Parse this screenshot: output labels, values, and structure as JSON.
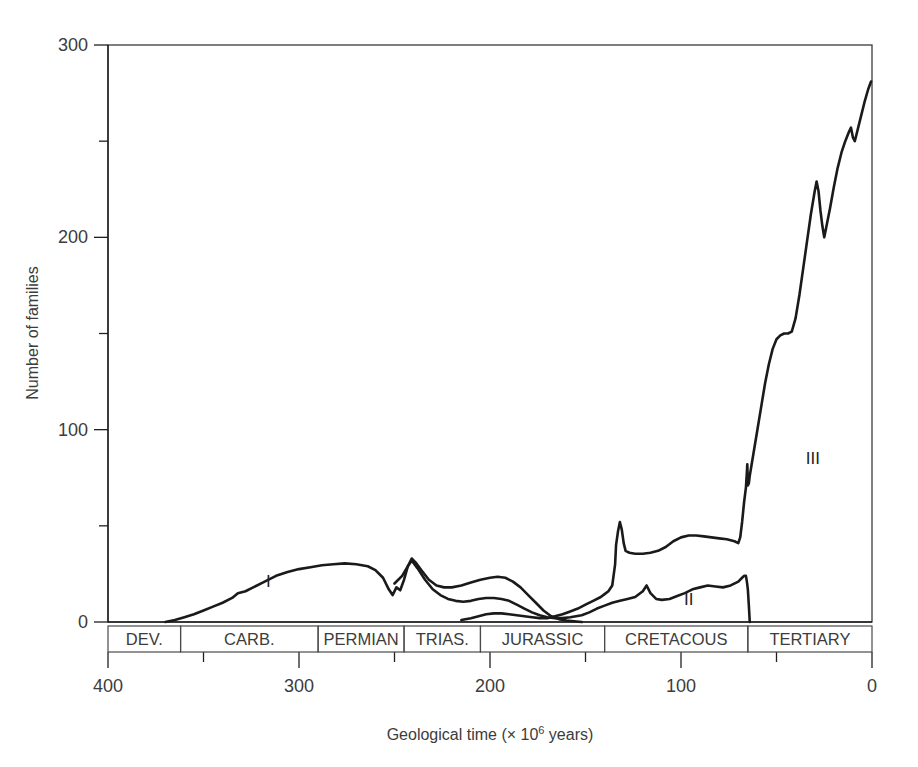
{
  "figure": {
    "title": "",
    "background": "#ffffff",
    "line_color": "#1a1a1a",
    "axis_color": "#231f20"
  },
  "axes": {
    "y_title": "Number of families",
    "x_title_prefix": "Geological time (× 10",
    "x_title_sup": "6",
    "x_title_suffix": " years)",
    "y_ticks_major": [
      "0",
      "100",
      "200",
      "300"
    ],
    "x_ticks_major": [
      "400",
      "300",
      "200",
      "100",
      "0"
    ]
  },
  "periods": [
    {
      "label": "DEV.",
      "start": 400,
      "end": 362
    },
    {
      "label": "CARB.",
      "start": 362,
      "end": 290
    },
    {
      "label": "PERMIAN",
      "start": 290,
      "end": 245
    },
    {
      "label": "TRIAS.",
      "start": 245,
      "end": 205
    },
    {
      "label": "JURASSIC",
      "start": 205,
      "end": 140
    },
    {
      "label": "CRETACOUS",
      "start": 140,
      "end": 65
    },
    {
      "label": "TERTIARY",
      "start": 65,
      "end": 0
    }
  ],
  "curve_labels": [
    {
      "text": "I",
      "x": 316,
      "y": 18
    },
    {
      "text": "II",
      "x": 96,
      "y": 9
    },
    {
      "text": "III",
      "x": 31,
      "y": 82
    }
  ],
  "chart_data": {
    "type": "line",
    "title": "",
    "xlabel": "Geological time (× 10^6 years)",
    "ylabel": "Number of families",
    "xlim": [
      400,
      0
    ],
    "ylim": [
      0,
      300
    ],
    "x_reversed": true,
    "grid": false,
    "legend": "inline-roman-numerals",
    "y_ticks_major": [
      0,
      100,
      200,
      300
    ],
    "y_ticks_minor": [
      50,
      150,
      250
    ],
    "x_ticks_major": [
      400,
      300,
      200,
      100,
      0
    ],
    "x_ticks_minor": [
      350,
      250,
      150,
      50
    ],
    "series": [
      {
        "name": "I",
        "points": [
          [
            370,
            0
          ],
          [
            365,
            1
          ],
          [
            360,
            2.5
          ],
          [
            355,
            4
          ],
          [
            350,
            6
          ],
          [
            345,
            8
          ],
          [
            340,
            10
          ],
          [
            335,
            12.5
          ],
          [
            332,
            15
          ],
          [
            328,
            16
          ],
          [
            324,
            18
          ],
          [
            318,
            21
          ],
          [
            312,
            24
          ],
          [
            306,
            26
          ],
          [
            300,
            27.5
          ],
          [
            294,
            28.5
          ],
          [
            288,
            29.5
          ],
          [
            282,
            30
          ],
          [
            276,
            30.5
          ],
          [
            270,
            30
          ],
          [
            264,
            29
          ],
          [
            260,
            27
          ],
          [
            256,
            23
          ],
          [
            253,
            17
          ],
          [
            251,
            14
          ],
          [
            249,
            18
          ],
          [
            247,
            16.5
          ],
          [
            245,
            22
          ],
          [
            243,
            29
          ],
          [
            241,
            33
          ],
          [
            239,
            31
          ],
          [
            236,
            27
          ],
          [
            232,
            22
          ],
          [
            228,
            19
          ],
          [
            224,
            18
          ],
          [
            220,
            18
          ],
          [
            215,
            19
          ],
          [
            210,
            20.5
          ],
          [
            205,
            22
          ],
          [
            200,
            23
          ],
          [
            196,
            23.5
          ],
          [
            192,
            23
          ],
          [
            188,
            21
          ],
          [
            184,
            18
          ],
          [
            180,
            14
          ],
          [
            176,
            10
          ],
          [
            172,
            6
          ],
          [
            168,
            3
          ],
          [
            164,
            1.5
          ],
          [
            160,
            0.8
          ],
          [
            156,
            0.4
          ],
          [
            152,
            0
          ]
        ]
      },
      {
        "name": "II",
        "points": [
          [
            250,
            20
          ],
          [
            246,
            24
          ],
          [
            243,
            29
          ],
          [
            241,
            32
          ],
          [
            238,
            28
          ],
          [
            234,
            22
          ],
          [
            230,
            17
          ],
          [
            226,
            14
          ],
          [
            222,
            12
          ],
          [
            218,
            11
          ],
          [
            214,
            10.5
          ],
          [
            210,
            11
          ],
          [
            206,
            12
          ],
          [
            202,
            12.5
          ],
          [
            198,
            12.5
          ],
          [
            194,
            12
          ],
          [
            190,
            11
          ],
          [
            186,
            9
          ],
          [
            182,
            7
          ],
          [
            178,
            5
          ],
          [
            174,
            3.5
          ],
          [
            170,
            2.5
          ],
          [
            166,
            2
          ],
          [
            162,
            2
          ],
          [
            158,
            2.5
          ],
          [
            152,
            3.5
          ],
          [
            148,
            5
          ],
          [
            144,
            7
          ],
          [
            140,
            8.5
          ],
          [
            136,
            10
          ],
          [
            132,
            11
          ],
          [
            128,
            12
          ],
          [
            124,
            13
          ],
          [
            120,
            16
          ],
          [
            118,
            19
          ],
          [
            116,
            15
          ],
          [
            113,
            12
          ],
          [
            110,
            11.5
          ],
          [
            106,
            12
          ],
          [
            102,
            13.5
          ],
          [
            98,
            15
          ],
          [
            94,
            17
          ],
          [
            90,
            18
          ],
          [
            86,
            19
          ],
          [
            82,
            18.5
          ],
          [
            78,
            18
          ],
          [
            74,
            19
          ],
          [
            70,
            21
          ],
          [
            68,
            23
          ],
          [
            67,
            24
          ],
          [
            66,
            24
          ],
          [
            65.5,
            21
          ],
          [
            65,
            17
          ],
          [
            64.5,
            9
          ],
          [
            64,
            0
          ]
        ]
      },
      {
        "name": "III",
        "points": [
          [
            215,
            1
          ],
          [
            210,
            2
          ],
          [
            206,
            3
          ],
          [
            202,
            4
          ],
          [
            198,
            4.5
          ],
          [
            194,
            4.5
          ],
          [
            190,
            4
          ],
          [
            186,
            3.5
          ],
          [
            182,
            3
          ],
          [
            178,
            2.5
          ],
          [
            174,
            2
          ],
          [
            170,
            2
          ],
          [
            166,
            3
          ],
          [
            162,
            4
          ],
          [
            158,
            5.5
          ],
          [
            154,
            7
          ],
          [
            150,
            9
          ],
          [
            146,
            11
          ],
          [
            142,
            13
          ],
          [
            140,
            14.5
          ],
          [
            138,
            16
          ],
          [
            136,
            19
          ],
          [
            134.5,
            30
          ],
          [
            134,
            40
          ],
          [
            133,
            47
          ],
          [
            132,
            52
          ],
          [
            131,
            48
          ],
          [
            130,
            41
          ],
          [
            129,
            37
          ],
          [
            127,
            36
          ],
          [
            124,
            35.5
          ],
          [
            120,
            35.5
          ],
          [
            116,
            36
          ],
          [
            112,
            37
          ],
          [
            108,
            39
          ],
          [
            104,
            42
          ],
          [
            100,
            44
          ],
          [
            96,
            45
          ],
          [
            92,
            45
          ],
          [
            88,
            44.5
          ],
          [
            84,
            44
          ],
          [
            80,
            43.5
          ],
          [
            76,
            43
          ],
          [
            72,
            42
          ],
          [
            70,
            41
          ],
          [
            69,
            44
          ],
          [
            68,
            52
          ],
          [
            67,
            62
          ],
          [
            66,
            70
          ],
          [
            65.5,
            78
          ],
          [
            65.3,
            82
          ],
          [
            65.1,
            76
          ],
          [
            65,
            71
          ],
          [
            64.5,
            72
          ],
          [
            64,
            76
          ],
          [
            62,
            88
          ],
          [
            60,
            100
          ],
          [
            58,
            112
          ],
          [
            56,
            124
          ],
          [
            54,
            134
          ],
          [
            52,
            142
          ],
          [
            50,
            147
          ],
          [
            48,
            149
          ],
          [
            46,
            150
          ],
          [
            44,
            150
          ],
          [
            42,
            151
          ],
          [
            40,
            158
          ],
          [
            38,
            170
          ],
          [
            36,
            184
          ],
          [
            34,
            198
          ],
          [
            32,
            212
          ],
          [
            30,
            224
          ],
          [
            29,
            229
          ],
          [
            28,
            224
          ],
          [
            27,
            214
          ],
          [
            26,
            206
          ],
          [
            25,
            200
          ],
          [
            24,
            205
          ],
          [
            22,
            215
          ],
          [
            20,
            226
          ],
          [
            18,
            236
          ],
          [
            16,
            244
          ],
          [
            14,
            250
          ],
          [
            12,
            255
          ],
          [
            11,
            257
          ],
          [
            10,
            252
          ],
          [
            9,
            250
          ],
          [
            8,
            254
          ],
          [
            6,
            262
          ],
          [
            4,
            270
          ],
          [
            2,
            277
          ],
          [
            0.5,
            281
          ]
        ]
      }
    ]
  }
}
